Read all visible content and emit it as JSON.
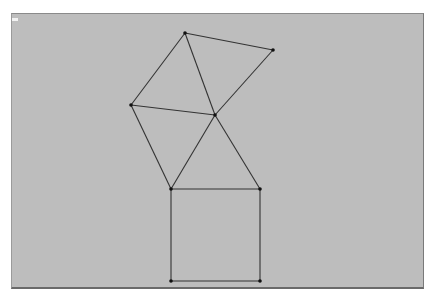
{
  "diagram": {
    "background": "#bdbdbd",
    "line_color": "#333333",
    "points": {
      "A": [
        185,
        33
      ],
      "B": [
        273,
        50
      ],
      "C": [
        131,
        105
      ],
      "D": [
        215,
        115
      ],
      "E": [
        171,
        189
      ],
      "F": [
        260,
        189
      ],
      "G": [
        171,
        281
      ],
      "H": [
        260,
        281
      ]
    },
    "segments": [
      [
        "A",
        "B"
      ],
      [
        "B",
        "D"
      ],
      [
        "A",
        "C"
      ],
      [
        "C",
        "D"
      ],
      [
        "A",
        "D"
      ],
      [
        "C",
        "E"
      ],
      [
        "E",
        "D"
      ],
      [
        "D",
        "F"
      ],
      [
        "E",
        "F"
      ],
      [
        "E",
        "G"
      ],
      [
        "F",
        "H"
      ],
      [
        "G",
        "H"
      ]
    ]
  }
}
